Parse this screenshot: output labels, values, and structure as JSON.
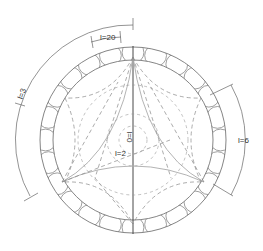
{
  "diagram": {
    "type": "spherical-harmonic-orbit-diagram",
    "center": [
      133,
      140
    ],
    "outer_radius": 93,
    "inner_radius": 80,
    "boundary_scallops": 24,
    "stroke_color": "#555555",
    "light_stroke_color": "#aaaaaa",
    "labels": {
      "l20": "l=20",
      "l3": "l=3",
      "l0": "l=0",
      "l2": "l=2",
      "l6": "l=6"
    }
  }
}
